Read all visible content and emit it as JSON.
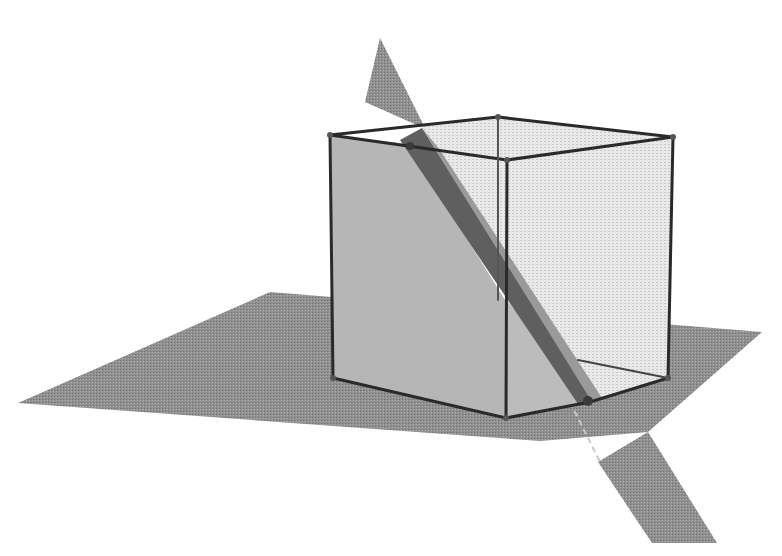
{
  "diagram": {
    "title": "Cube cut by an oblique plane, resting on a ground plane",
    "labels": [],
    "colors": {
      "ground_plane": "#8f8f8f",
      "cutting_plane": "#7d7d7d",
      "cutting_plane_dark": "#5e5e5e",
      "cube_left_face": "#b4b4b4",
      "cube_right_face": "#e6e6e6",
      "cube_edge": "#2a2a2a",
      "background": "#ffffff"
    },
    "shapes": {
      "ground_plane": "18,403 270,292 762,332 648,432 540,441",
      "cut_strip_lower": "598,465 648,432 717,543 652,543",
      "cutting_plane_upper": "380,38 363,100 420,120",
      "cube_left_face": "330,135 410,147 503,300 590,402 506,418 333,378",
      "cube_right_face": "420,128 498,117 673,137 668,378 590,402 503,300",
      "cut_plane_band": "405,145 420,128 590,402 575,400",
      "cut_plane_face": "420,128 440,150 598,395 590,402"
    },
    "edges": [
      {
        "from": [
          330,
          135
        ],
        "to": [
          507,
          160
        ]
      },
      {
        "from": [
          507,
          160
        ],
        "to": [
          673,
          137
        ]
      },
      {
        "from": [
          673,
          137
        ],
        "to": [
          498,
          117
        ]
      },
      {
        "from": [
          498,
          117
        ],
        "to": [
          330,
          135
        ]
      },
      {
        "from": [
          330,
          135
        ],
        "to": [
          333,
          378
        ]
      },
      {
        "from": [
          507,
          160
        ],
        "to": [
          506,
          418
        ]
      },
      {
        "from": [
          673,
          137
        ],
        "to": [
          668,
          378
        ]
      },
      {
        "from": [
          498,
          117
        ],
        "to": [
          498,
          300
        ]
      },
      {
        "from": [
          333,
          378
        ],
        "to": [
          506,
          418
        ]
      },
      {
        "from": [
          506,
          418
        ],
        "to": [
          590,
          402
        ]
      },
      {
        "from": [
          590,
          402
        ],
        "to": [
          668,
          378
        ]
      },
      {
        "from": [
          498,
          300
        ],
        "to": [
          668,
          378
        ]
      }
    ],
    "vertices": [
      [
        330,
        135
      ],
      [
        507,
        160
      ],
      [
        673,
        137
      ],
      [
        498,
        117
      ],
      [
        333,
        378
      ],
      [
        506,
        418
      ],
      [
        668,
        378
      ],
      [
        590,
        402
      ],
      [
        410,
        147
      ]
    ]
  }
}
